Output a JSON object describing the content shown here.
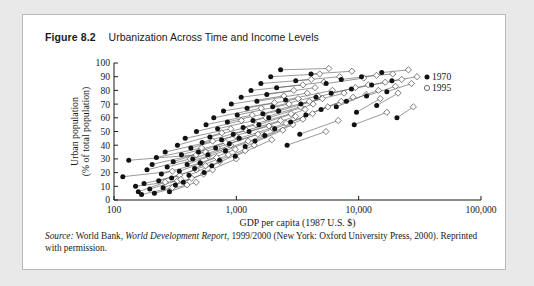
{
  "figure": {
    "number": "Figure 8.2",
    "caption": "Urbanization Across Time and Income Levels"
  },
  "source": {
    "label": "Source:",
    "text_1": " World Bank, ",
    "italic_title": "World Development Report",
    "text_2": ", 1999/2000 (New York: Oxford University Press, 2000). Reprinted with permission."
  },
  "chart_data": {
    "type": "scatter",
    "title": "Urbanization Across Time and Income Levels",
    "xlabel": "GDP per capita (1987 U.S. $)",
    "ylabel": "Urban population (% of total population)",
    "xscale": "log",
    "xlim": [
      100,
      100000
    ],
    "ylim": [
      0,
      100
    ],
    "xticks": [
      100,
      1000,
      10000,
      100000
    ],
    "xticklabels": [
      "100",
      "1,000",
      "10,000",
      "100,000"
    ],
    "yticks": [
      0,
      10,
      20,
      30,
      40,
      50,
      60,
      70,
      80,
      90,
      100
    ],
    "yticklabels": [
      "0",
      "10",
      "20",
      "30",
      "40",
      "50",
      "60",
      "70",
      "80",
      "90",
      "100"
    ],
    "grid": false,
    "legend_position": "top-right",
    "series": [
      {
        "name": "1970",
        "marker": "filled-circle",
        "color": "#111111"
      },
      {
        "name": "1995",
        "marker": "open-diamond",
        "color": "#111111"
      }
    ],
    "connector_note": "Each country is drawn as a line from its 1970 point to its 1995 point.",
    "pairs": [
      {
        "x1970": 118,
        "y1970": 17,
        "x1995": 300,
        "y1995": 21
      },
      {
        "x1970": 132,
        "y1970": 29,
        "x1995": 470,
        "y1995": 33
      },
      {
        "x1970": 150,
        "y1970": 10,
        "x1995": 330,
        "y1995": 14
      },
      {
        "x1970": 158,
        "y1970": 6,
        "x1995": 262,
        "y1995": 13
      },
      {
        "x1970": 168,
        "y1970": 4,
        "x1995": 300,
        "y1995": 9
      },
      {
        "x1970": 176,
        "y1970": 12,
        "x1995": 345,
        "y1995": 18
      },
      {
        "x1970": 186,
        "y1970": 22,
        "x1995": 420,
        "y1995": 30
      },
      {
        "x1970": 196,
        "y1970": 8,
        "x1995": 352,
        "y1995": 15
      },
      {
        "x1970": 205,
        "y1970": 26,
        "x1995": 560,
        "y1995": 35
      },
      {
        "x1970": 214,
        "y1970": 5,
        "x1995": 395,
        "y1995": 11
      },
      {
        "x1970": 222,
        "y1970": 31,
        "x1995": 520,
        "y1995": 38
      },
      {
        "x1970": 232,
        "y1970": 14,
        "x1995": 470,
        "y1995": 22
      },
      {
        "x1970": 244,
        "y1970": 19,
        "x1995": 505,
        "y1995": 27
      },
      {
        "x1970": 252,
        "y1970": 9,
        "x1995": 430,
        "y1995": 16
      },
      {
        "x1970": 262,
        "y1970": 35,
        "x1995": 640,
        "y1995": 43
      },
      {
        "x1970": 272,
        "y1970": 24,
        "x1995": 590,
        "y1995": 32
      },
      {
        "x1970": 284,
        "y1970": 6,
        "x1995": 470,
        "y1995": 13
      },
      {
        "x1970": 296,
        "y1970": 16,
        "x1995": 560,
        "y1995": 25
      },
      {
        "x1970": 305,
        "y1970": 28,
        "x1995": 700,
        "y1995": 38
      },
      {
        "x1970": 318,
        "y1970": 11,
        "x1995": 540,
        "y1995": 19
      },
      {
        "x1970": 330,
        "y1970": 40,
        "x1995": 760,
        "y1995": 49
      },
      {
        "x1970": 342,
        "y1970": 21,
        "x1995": 690,
        "y1995": 31
      },
      {
        "x1970": 356,
        "y1970": 33,
        "x1995": 820,
        "y1995": 42
      },
      {
        "x1970": 368,
        "y1970": 13,
        "x1995": 640,
        "y1995": 22
      },
      {
        "x1970": 382,
        "y1970": 45,
        "x1995": 900,
        "y1995": 52
      },
      {
        "x1970": 396,
        "y1970": 26,
        "x1995": 800,
        "y1995": 36
      },
      {
        "x1970": 410,
        "y1970": 18,
        "x1995": 730,
        "y1995": 28
      },
      {
        "x1970": 425,
        "y1970": 38,
        "x1995": 980,
        "y1995": 47
      },
      {
        "x1970": 440,
        "y1970": 30,
        "x1995": 900,
        "y1995": 40
      },
      {
        "x1970": 456,
        "y1970": 23,
        "x1995": 860,
        "y1995": 33
      },
      {
        "x1970": 472,
        "y1970": 50,
        "x1995": 1100,
        "y1995": 58
      },
      {
        "x1970": 490,
        "y1970": 35,
        "x1995": 1050,
        "y1995": 45
      },
      {
        "x1970": 508,
        "y1970": 27,
        "x1995": 980,
        "y1995": 37
      },
      {
        "x1970": 526,
        "y1970": 42,
        "x1995": 1200,
        "y1995": 51
      },
      {
        "x1970": 545,
        "y1970": 20,
        "x1995": 1000,
        "y1995": 30
      },
      {
        "x1970": 565,
        "y1970": 55,
        "x1995": 1350,
        "y1995": 62
      },
      {
        "x1970": 586,
        "y1970": 33,
        "x1995": 1250,
        "y1995": 43
      },
      {
        "x1970": 608,
        "y1970": 46,
        "x1995": 1450,
        "y1995": 55
      },
      {
        "x1970": 630,
        "y1970": 25,
        "x1995": 1180,
        "y1995": 36
      },
      {
        "x1970": 654,
        "y1970": 60,
        "x1995": 1600,
        "y1995": 67
      },
      {
        "x1970": 678,
        "y1970": 38,
        "x1995": 1500,
        "y1995": 48
      },
      {
        "x1970": 703,
        "y1970": 52,
        "x1995": 1750,
        "y1995": 60
      },
      {
        "x1970": 730,
        "y1970": 29,
        "x1995": 1400,
        "y1995": 40
      },
      {
        "x1970": 757,
        "y1970": 44,
        "x1995": 1850,
        "y1995": 54
      },
      {
        "x1970": 785,
        "y1970": 65,
        "x1995": 2050,
        "y1995": 71
      },
      {
        "x1970": 815,
        "y1970": 36,
        "x1995": 1700,
        "y1995": 47
      },
      {
        "x1970": 845,
        "y1970": 57,
        "x1995": 2200,
        "y1995": 65
      },
      {
        "x1970": 877,
        "y1970": 41,
        "x1995": 2000,
        "y1995": 52
      },
      {
        "x1970": 910,
        "y1970": 70,
        "x1995": 2450,
        "y1995": 76
      },
      {
        "x1970": 944,
        "y1970": 48,
        "x1995": 2300,
        "y1995": 58
      },
      {
        "x1970": 980,
        "y1970": 32,
        "x1995": 1950,
        "y1995": 44
      },
      {
        "x1970": 1017,
        "y1970": 62,
        "x1995": 2700,
        "y1995": 70
      },
      {
        "x1970": 1055,
        "y1970": 45,
        "x1995": 2550,
        "y1995": 56
      },
      {
        "x1970": 1095,
        "y1970": 75,
        "x1995": 2950,
        "y1995": 80
      },
      {
        "x1970": 1136,
        "y1970": 53,
        "x1995": 2800,
        "y1995": 63
      },
      {
        "x1970": 1180,
        "y1970": 39,
        "x1995": 2400,
        "y1995": 51
      },
      {
        "x1970": 1224,
        "y1970": 67,
        "x1995": 3200,
        "y1995": 74
      },
      {
        "x1970": 1270,
        "y1970": 50,
        "x1995": 3050,
        "y1995": 61
      },
      {
        "x1970": 1318,
        "y1970": 80,
        "x1995": 3500,
        "y1995": 84
      },
      {
        "x1970": 1368,
        "y1970": 58,
        "x1995": 3350,
        "y1995": 68
      },
      {
        "x1970": 1420,
        "y1970": 43,
        "x1995": 2900,
        "y1995": 55
      },
      {
        "x1970": 1473,
        "y1970": 72,
        "x1995": 3800,
        "y1995": 78
      },
      {
        "x1970": 1529,
        "y1970": 55,
        "x1995": 3650,
        "y1995": 66
      },
      {
        "x1970": 1587,
        "y1970": 85,
        "x1995": 4100,
        "y1995": 88
      },
      {
        "x1970": 1647,
        "y1970": 63,
        "x1995": 3950,
        "y1995": 72
      },
      {
        "x1970": 1709,
        "y1970": 47,
        "x1995": 3500,
        "y1995": 59
      },
      {
        "x1970": 1773,
        "y1970": 77,
        "x1995": 4400,
        "y1995": 82
      },
      {
        "x1970": 1840,
        "y1970": 60,
        "x1995": 4250,
        "y1995": 70
      },
      {
        "x1970": 1910,
        "y1970": 90,
        "x1995": 4800,
        "y1995": 92
      },
      {
        "x1970": 1982,
        "y1970": 68,
        "x1995": 4650,
        "y1995": 76
      },
      {
        "x1970": 2057,
        "y1970": 52,
        "x1995": 4200,
        "y1995": 63
      },
      {
        "x1970": 2135,
        "y1970": 82,
        "x1995": 5200,
        "y1995": 86
      },
      {
        "x1970": 2215,
        "y1970": 65,
        "x1995": 5050,
        "y1995": 74
      },
      {
        "x1970": 2300,
        "y1970": 95,
        "x1995": 5700,
        "y1995": 96
      },
      {
        "x1970": 2530,
        "y1970": 73,
        "x1995": 6100,
        "y1995": 80
      },
      {
        "x1970": 2780,
        "y1970": 57,
        "x1995": 5600,
        "y1995": 68
      },
      {
        "x1970": 3060,
        "y1970": 87,
        "x1995": 7000,
        "y1995": 90
      },
      {
        "x1970": 3370,
        "y1970": 70,
        "x1995": 7600,
        "y1995": 78
      },
      {
        "x1970": 3700,
        "y1970": 62,
        "x1995": 7200,
        "y1995": 72
      },
      {
        "x1970": 4080,
        "y1970": 92,
        "x1995": 8800,
        "y1995": 94
      },
      {
        "x1970": 4480,
        "y1970": 75,
        "x1995": 9400,
        "y1995": 82
      },
      {
        "x1970": 4930,
        "y1970": 66,
        "x1995": 9000,
        "y1995": 75
      },
      {
        "x1970": 5420,
        "y1970": 85,
        "x1995": 11000,
        "y1995": 89
      },
      {
        "x1970": 5960,
        "y1970": 78,
        "x1995": 12000,
        "y1995": 84
      },
      {
        "x1970": 6560,
        "y1970": 68,
        "x1995": 11500,
        "y1995": 77
      },
      {
        "x1970": 7210,
        "y1970": 88,
        "x1995": 14000,
        "y1995": 91
      },
      {
        "x1970": 7930,
        "y1970": 72,
        "x1995": 14500,
        "y1995": 80
      },
      {
        "x1970": 8730,
        "y1970": 81,
        "x1995": 16500,
        "y1995": 86
      },
      {
        "x1970": 9600,
        "y1970": 64,
        "x1995": 15000,
        "y1995": 74
      },
      {
        "x1970": 10550,
        "y1970": 90,
        "x1995": 19000,
        "y1995": 92
      },
      {
        "x1970": 11600,
        "y1970": 76,
        "x1995": 20000,
        "y1995": 83
      },
      {
        "x1970": 12760,
        "y1970": 84,
        "x1995": 22500,
        "y1995": 88
      },
      {
        "x1970": 14040,
        "y1970": 69,
        "x1995": 21000,
        "y1995": 78
      },
      {
        "x1970": 15440,
        "y1970": 93,
        "x1995": 25500,
        "y1995": 95
      },
      {
        "x1970": 16990,
        "y1970": 79,
        "x1995": 27000,
        "y1995": 85
      },
      {
        "x1970": 18690,
        "y1970": 87,
        "x1995": 30000,
        "y1995": 90
      },
      {
        "x1970": 20550,
        "y1970": 60,
        "x1995": 28000,
        "y1995": 68
      },
      {
        "x1970": 9200,
        "y1970": 55,
        "x1995": 17000,
        "y1995": 64
      },
      {
        "x1970": 3300,
        "y1970": 48,
        "x1995": 6800,
        "y1995": 58
      },
      {
        "x1970": 2600,
        "y1970": 40,
        "x1995": 5400,
        "y1995": 50
      }
    ]
  }
}
